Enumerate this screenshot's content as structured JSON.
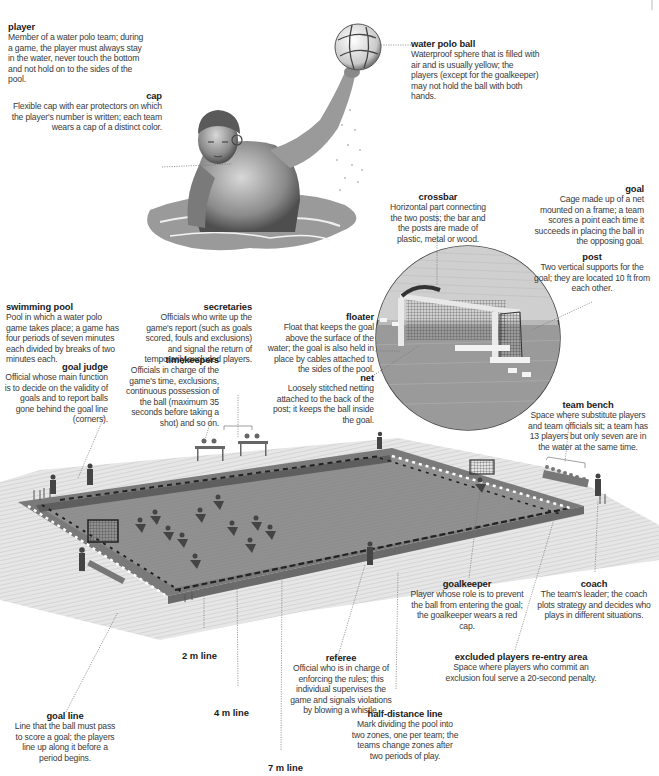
{
  "diagram": {
    "subject": "Water polo",
    "colors": {
      "water": "#8c8c8c",
      "water_dark": "#6e6e6e",
      "deck": "#d6d6d6",
      "leader_line": "#777777",
      "text_title": "#1a1a1a",
      "text_body": "#3a3a3a"
    }
  },
  "labels": {
    "player": {
      "title": "player",
      "desc": "Member of a water polo team; during a game, the player must always stay in the water, never touch the bottom and not hold on to the sides of the pool."
    },
    "cap": {
      "title": "cap",
      "desc": "Flexible cap with ear protectors on which the player's number is written; each team wears a cap of a distinct color."
    },
    "water_polo_ball": {
      "title": "water polo ball",
      "desc": "Waterproof sphere that is filled with air and is usually yellow; the players (except for the goalkeeper) may not hold the ball with both hands."
    },
    "crossbar": {
      "title": "crossbar",
      "desc": "Horizontal part connecting the two posts; the bar and the posts are made of plastic, metal or wood."
    },
    "goal": {
      "title": "goal",
      "desc": "Cage made up of a net mounted on a frame; a team scores a point each time it succeeds in placing the ball in the opposing goal."
    },
    "post": {
      "title": "post",
      "desc": "Two vertical supports for the goal; they are located 10 ft from each other."
    },
    "swimming_pool": {
      "title": "swimming pool",
      "desc": "Pool in which a water polo game takes place; a game has four periods of seven minutes each divided by breaks of two minutes each."
    },
    "secretaries": {
      "title": "secretaries",
      "desc": "Officials who write up the game's report (such as goals scored, fouls and exclusions) and signal the return of temporarily excluded players."
    },
    "timekeepers": {
      "title": "timekeepers",
      "desc": "Officials in charge of the game's time, exclusions, continuous possession of the ball (maximum 35 seconds before taking a shot) and so on."
    },
    "goal_judge": {
      "title": "goal judge",
      "desc": "Official whose main function is to decide on the validity of goals and to report balls gone behind the goal line (corners)."
    },
    "floater": {
      "title": "floater",
      "desc": "Float that keeps the goal above the surface of the water; the goal is also held in place by cables attached to the sides of the pool."
    },
    "net": {
      "title": "net",
      "desc": "Loosely stitched netting attached to the back of the post; it keeps the ball inside the goal."
    },
    "team_bench": {
      "title": "team bench",
      "desc": "Space where substitute players and team officials sit; a team has 13 players but only seven are in the water at the same time."
    },
    "goalkeeper": {
      "title": "goalkeeper",
      "desc": "Player whose role is to prevent the ball from entering the goal; the goalkeeper wears a red cap."
    },
    "coach": {
      "title": "coach",
      "desc": "The team's leader; the coach plots strategy and decides who plays in different situations."
    },
    "excluded_area": {
      "title": "excluded players re-entry area",
      "desc": "Space where players who commit an exclusion foul serve a 20-second penalty."
    },
    "referee": {
      "title": "referee",
      "desc": "Official who is in charge of enforcing the rules; this individual supervises the game and signals violations by blowing a whistle."
    },
    "half_distance_line": {
      "title": "half-distance line",
      "desc": "Mark dividing the pool into two zones, one per team; the teams change zones after two periods of play."
    },
    "goal_line": {
      "title": "goal line",
      "desc": "Line that the ball must pass to score a goal; the players line up along it before a period begins."
    },
    "line_2m": {
      "title": "2 m line"
    },
    "line_4m": {
      "title": "4 m line"
    },
    "line_7m": {
      "title": "7 m line"
    }
  }
}
